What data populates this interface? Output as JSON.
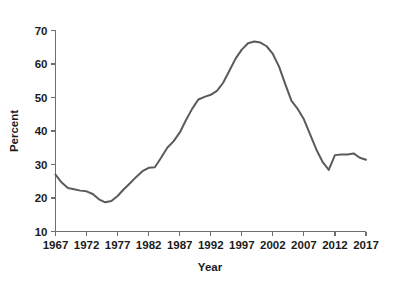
{
  "chart_data": {
    "type": "line",
    "title": "",
    "xlabel": "Year",
    "ylabel": "Percent",
    "xlim": [
      1967,
      2017
    ],
    "ylim": [
      10,
      70
    ],
    "xticks": [
      1967,
      1972,
      1977,
      1982,
      1987,
      1992,
      1997,
      2002,
      2007,
      2012,
      2017
    ],
    "yticks": [
      10,
      20,
      30,
      40,
      50,
      60,
      70
    ],
    "grid": false,
    "legend": null,
    "line_color": "#5b5b5b",
    "axis_color": "#6e6e6e",
    "series": [
      {
        "name": "Percent",
        "x": [
          1967,
          1968,
          1969,
          1970,
          1971,
          1972,
          1973,
          1974,
          1975,
          1976,
          1977,
          1978,
          1979,
          1980,
          1981,
          1982,
          1983,
          1984,
          1985,
          1986,
          1987,
          1988,
          1989,
          1990,
          1991,
          1992,
          1993,
          1994,
          1995,
          1996,
          1997,
          1998,
          1999,
          2000,
          2001,
          2002,
          2003,
          2004,
          2005,
          2006,
          2007,
          2008,
          2009,
          2010,
          2011,
          2012,
          2013,
          2014,
          2015,
          2016,
          2017
        ],
        "values": [
          27.0,
          24.6,
          23.0,
          22.6,
          22.2,
          22.0,
          21.2,
          19.6,
          18.7,
          19.1,
          20.6,
          22.6,
          24.4,
          26.3,
          28.0,
          29.0,
          29.2,
          32.0,
          35.0,
          36.9,
          39.5,
          43.2,
          46.6,
          49.4,
          50.2,
          50.8,
          52.0,
          54.4,
          58.0,
          61.6,
          64.3,
          66.2,
          66.7,
          66.4,
          65.3,
          63.0,
          59.2,
          54.0,
          49.0,
          46.6,
          43.5,
          39.0,
          34.5,
          30.8,
          28.4,
          32.8,
          33.0,
          33.0,
          33.3,
          32.0,
          31.4
        ],
        "markers": false
      }
    ],
    "annotations": []
  },
  "axes": {
    "y_tick_labels": [
      "70",
      "60",
      "50",
      "40",
      "30",
      "20",
      "10"
    ],
    "x_tick_labels": [
      "1967",
      "1972",
      "1977",
      "1982",
      "1987",
      "1992",
      "1997",
      "2002",
      "2007",
      "2012",
      "2017"
    ],
    "y_axis_title": "Percent",
    "x_axis_title": "Year"
  }
}
